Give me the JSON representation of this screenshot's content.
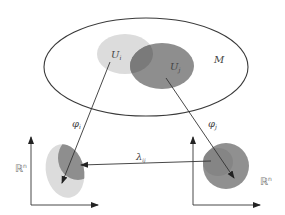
{
  "diagram": {
    "manifold": {
      "label": "M"
    },
    "open_sets": [
      {
        "id": "Ui",
        "label": "U",
        "subscript": "i",
        "color": "#d9d9d9"
      },
      {
        "id": "Uj",
        "label": "U",
        "subscript": "j",
        "color": "#8c8c8c"
      }
    ],
    "maps": [
      {
        "id": "phi_i",
        "label": "φ",
        "subscript": "i"
      },
      {
        "id": "phi_j",
        "label": "φ",
        "subscript": "j"
      },
      {
        "id": "lambda_ij",
        "label": "λ",
        "subscript": "ij"
      }
    ],
    "spaces": [
      {
        "id": "left",
        "label": "ℝ",
        "superscript": "n"
      },
      {
        "id": "right",
        "label": "ℝ",
        "superscript": "n"
      }
    ],
    "colors": {
      "outline": "#333333",
      "light_fill": "#dcdcdc",
      "dark_fill": "#8a8a8a",
      "arrow": "#333333"
    }
  }
}
